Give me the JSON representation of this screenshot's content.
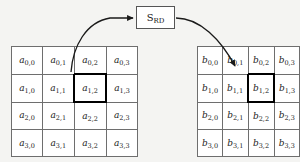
{
  "figure": {
    "background_color": "#f4f4f2",
    "cell_border_color": "#6e6e6e",
    "highlight_border_color": "#000000",
    "arrow_color": "#1a1a1a"
  },
  "left_matrix": {
    "name": "matrix-a",
    "symbol": "a",
    "rows": 4,
    "cols": 4,
    "highlight_row": 1,
    "highlight_col": 2,
    "cells": [
      [
        {
          "base": "a",
          "sub": "0,0"
        },
        {
          "base": "a",
          "sub": "0,1"
        },
        {
          "base": "a",
          "sub": "0,2"
        },
        {
          "base": "a",
          "sub": "0,3"
        }
      ],
      [
        {
          "base": "a",
          "sub": "1,0"
        },
        {
          "base": "a",
          "sub": "1,1"
        },
        {
          "base": "a",
          "sub": "1,2"
        },
        {
          "base": "a",
          "sub": "1,3"
        }
      ],
      [
        {
          "base": "a",
          "sub": "2,0"
        },
        {
          "base": "a",
          "sub": "2,1"
        },
        {
          "base": "a",
          "sub": "2,2"
        },
        {
          "base": "a",
          "sub": "2,3"
        }
      ],
      [
        {
          "base": "a",
          "sub": "3,0"
        },
        {
          "base": "a",
          "sub": "3,1"
        },
        {
          "base": "a",
          "sub": "3,2"
        },
        {
          "base": "a",
          "sub": "3,3"
        }
      ]
    ]
  },
  "right_matrix": {
    "name": "matrix-b",
    "symbol": "b",
    "rows": 4,
    "cols": 4,
    "highlight_row": 1,
    "highlight_col": 2,
    "cells": [
      [
        {
          "base": "b",
          "sub": "0,0"
        },
        {
          "base": "b",
          "sub": "0,1"
        },
        {
          "base": "b",
          "sub": "0,2"
        },
        {
          "base": "b",
          "sub": "0,3"
        }
      ],
      [
        {
          "base": "b",
          "sub": "1,0"
        },
        {
          "base": "b",
          "sub": "1,1"
        },
        {
          "base": "b",
          "sub": "1,2"
        },
        {
          "base": "b",
          "sub": "1,3"
        }
      ],
      [
        {
          "base": "b",
          "sub": "2,0"
        },
        {
          "base": "b",
          "sub": "2,1"
        },
        {
          "base": "b",
          "sub": "2,2"
        },
        {
          "base": "b",
          "sub": "2,3"
        }
      ],
      [
        {
          "base": "b",
          "sub": "3,0"
        },
        {
          "base": "b",
          "sub": "3,1"
        },
        {
          "base": "b",
          "sub": "3,2"
        },
        {
          "base": "b",
          "sub": "3,3"
        }
      ]
    ]
  },
  "sbox": {
    "base": "S",
    "sub": "RD"
  }
}
